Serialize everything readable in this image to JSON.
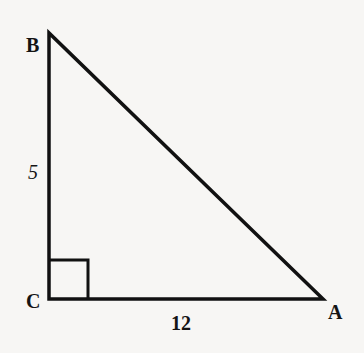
{
  "diagram": {
    "type": "right-triangle",
    "colors": {
      "stroke": "#111111",
      "background": "#f7f6f4",
      "text": "#141414"
    },
    "vertices": {
      "B": {
        "label": "B",
        "x": 49,
        "y": 33
      },
      "C": {
        "label": "C",
        "x": 49,
        "y": 299
      },
      "A": {
        "label": "A",
        "x": 323,
        "y": 299
      }
    },
    "sides": {
      "BC": {
        "label": "5"
      },
      "CA": {
        "label": "12"
      }
    },
    "right_angle_at": "C"
  }
}
